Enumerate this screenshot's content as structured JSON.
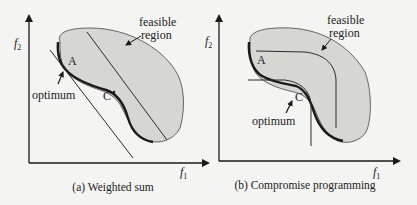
{
  "colors": {
    "background": "#f4f4f2",
    "region_fill": "#d6d6d4",
    "line": "#2a2a2a",
    "pareto": "#1a1a1a"
  },
  "panels": [
    {
      "id": "a",
      "caption": "(a) Weighted sum",
      "x_axis_label": "f",
      "x_axis_sub": "1",
      "y_axis_label": "f",
      "y_axis_sub": "2",
      "region_label_line1": "feasible",
      "region_label_line2": "region",
      "point_a": "A",
      "point_c": "C",
      "optimum_label": "optimum"
    },
    {
      "id": "b",
      "caption": "(b) Compromise programming",
      "x_axis_label": "f",
      "x_axis_sub": "1",
      "y_axis_label": "f",
      "y_axis_sub": "2",
      "region_label_line1": "feasible",
      "region_label_line2": "region",
      "point_a": "A",
      "point_c": "C",
      "optimum_label": "optimum"
    }
  ]
}
